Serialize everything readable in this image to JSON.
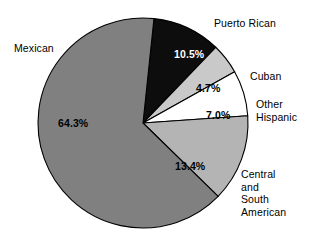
{
  "chart_data": {
    "type": "pie",
    "title": "",
    "subtitle": "",
    "xlabel": "",
    "ylabel": "",
    "legend_position": "none",
    "grid": false,
    "unit": "%",
    "categories": [
      "Puerto Rican",
      "Cuban",
      "Other Hispanic",
      "Central and South American",
      "Mexican"
    ],
    "values": [
      10.5,
      4.7,
      7.0,
      13.4,
      64.3
    ],
    "slices": [
      {
        "name": "Puerto Rican",
        "label": "Puerto Rican",
        "value": 10.5,
        "value_label": "10.5%",
        "color": "#0d0d0d",
        "text_color": "#ffffff"
      },
      {
        "name": "Cuban",
        "label": "Cuban",
        "value": 4.7,
        "value_label": "4.7%",
        "color": "#c9c9c9",
        "text_color": "#000000"
      },
      {
        "name": "Other Hispanic",
        "label": "Other\nHispanic",
        "label_line1": "Other",
        "label_line2": "Hispanic",
        "value": 7.0,
        "value_label": "7.0%",
        "color": "#ffffff",
        "text_color": "#000000"
      },
      {
        "name": "Central and South American",
        "label": "Central\nand\nSouth\nAmerican",
        "label_line1": "Central",
        "label_line2": "and",
        "label_line3": "South",
        "label_line4": "American",
        "value": 13.4,
        "value_label": "13.4%",
        "color": "#b4b4b4",
        "text_color": "#000000"
      },
      {
        "name": "Mexican",
        "label": "Mexican",
        "value": 64.3,
        "value_label": "64.3%",
        "color": "#808080",
        "text_color": "#000000"
      }
    ],
    "start_angle_deg": 6,
    "direction": "clockwise",
    "outline_color": "#000000",
    "background": "#ffffff"
  },
  "figure": {
    "center_x": 143,
    "center_y": 123,
    "radius": 105
  }
}
